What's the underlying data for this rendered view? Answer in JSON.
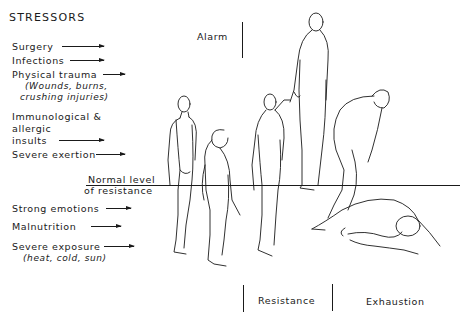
{
  "title": "STRESSORS",
  "stressors": [
    {
      "label": "Surgery"
    },
    {
      "label": "Infections"
    },
    {
      "label": "Physical trauma",
      "note_line1": "(Wounds, burns,",
      "note_line2": "crushing injuries)"
    },
    {
      "label_line1": "Immunological &",
      "label_line2": "allergic",
      "label_line3": "insults"
    },
    {
      "label": "Severe exertion"
    },
    {
      "label": "Strong emotions"
    },
    {
      "label": "Malnutrition"
    },
    {
      "label": "Severe exposure",
      "note": "(heat, cold, sun)"
    }
  ],
  "baseline": {
    "label_line1": "Normal level",
    "label_line2": "of resistance"
  },
  "stages": {
    "alarm": "Alarm",
    "resistance": "Resistance",
    "exhaustion": "Exhaustion"
  },
  "figures": [
    "standing-normal-figure",
    "slumped-alarm-figure",
    "recovering-figure",
    "tall-resistance-figure",
    "stooped-exhaustion-figure",
    "collapsed-exhaustion-figure"
  ],
  "colors": {
    "ink": "#1a1a1a",
    "background": "#ffffff"
  }
}
